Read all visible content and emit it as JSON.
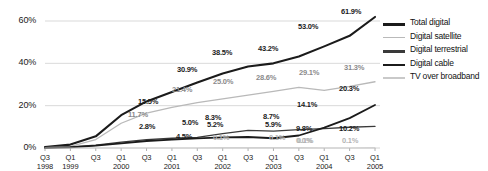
{
  "chart_data": {
    "type": "line",
    "title": "",
    "xlabel": "",
    "ylabel": "",
    "ylim": [
      0,
      68
    ],
    "yticks": [
      "0%",
      "20%",
      "40%",
      "60%"
    ],
    "ytick_values": [
      0,
      20,
      40,
      60
    ],
    "grid": true,
    "legend_position": "right",
    "x": [
      {
        "q": "Q3",
        "yr": "1998"
      },
      {
        "q": "Q1",
        "yr": "1999"
      },
      {
        "q": "Q3",
        "yr": ""
      },
      {
        "q": "Q1",
        "yr": "2000"
      },
      {
        "q": "Q3",
        "yr": ""
      },
      {
        "q": "Q1",
        "yr": "2001"
      },
      {
        "q": "Q3",
        "yr": ""
      },
      {
        "q": "Q1",
        "yr": "2002"
      },
      {
        "q": "Q3",
        "yr": ""
      },
      {
        "q": "Q1",
        "yr": "2003"
      },
      {
        "q": "Q3",
        "yr": ""
      },
      {
        "q": "Q1",
        "yr": "2004"
      },
      {
        "q": "Q3",
        "yr": ""
      },
      {
        "q": "Q1",
        "yr": "2005"
      }
    ],
    "series": [
      {
        "name": "Total digital",
        "color": "#1b1b1b",
        "width": 2.1,
        "values": [
          0.4,
          1.6,
          5.5,
          15.5,
          22.0,
          26.5,
          30.9,
          35.2,
          38.5,
          40.0,
          43.2,
          48.0,
          53.0,
          61.9
        ]
      },
      {
        "name": "Digital satellite",
        "color": "#b9b9b9",
        "width": 1.3,
        "values": [
          0.2,
          0.8,
          4.0,
          11.7,
          16.5,
          19.2,
          21.4,
          23.2,
          25.0,
          26.8,
          28.6,
          27.2,
          29.1,
          31.3
        ]
      },
      {
        "name": "Digital terrestrial",
        "color": "#3a3a3a",
        "width": 1.3,
        "values": [
          0.1,
          0.5,
          1.3,
          2.8,
          4.0,
          4.6,
          5.0,
          6.8,
          8.3,
          8.0,
          8.7,
          9.2,
          9.8,
          10.2
        ]
      },
      {
        "name": "Digital cable",
        "color": "#1b1b1b",
        "width": 1.8,
        "values": [
          0.1,
          0.3,
          1.1,
          2.2,
          3.3,
          4.0,
          4.5,
          5.0,
          5.2,
          4.6,
          5.9,
          9.6,
          14.1,
          20.3
        ]
      },
      {
        "name": "TV over broadband",
        "color": "#c9c9c9",
        "width": 1.2,
        "values": [
          0.0,
          0.0,
          0.0,
          0.0,
          0.0,
          0.0,
          0.0,
          0.05,
          0.1,
          0.1,
          0.1,
          0.0,
          0.0,
          0.1
        ]
      }
    ],
    "point_labels": [
      {
        "text": "15.5%",
        "x": 138,
        "y": 97,
        "tone": "dark"
      },
      {
        "text": "30.9%",
        "x": 177,
        "y": 65,
        "tone": "dark"
      },
      {
        "text": "38.5%",
        "x": 212,
        "y": 48,
        "tone": "dark"
      },
      {
        "text": "43.2%",
        "x": 258,
        "y": 44,
        "tone": "dark"
      },
      {
        "text": "53.0%",
        "x": 298,
        "y": 22,
        "tone": "dark"
      },
      {
        "text": "61.9%",
        "x": 341,
        "y": 7,
        "tone": "dark"
      },
      {
        "text": "11.7%",
        "x": 128,
        "y": 110,
        "tone": "mid"
      },
      {
        "text": "21.4%",
        "x": 172,
        "y": 85,
        "tone": "mid"
      },
      {
        "text": "25.0%",
        "x": 213,
        "y": 77,
        "tone": "mid"
      },
      {
        "text": "28.6%",
        "x": 256,
        "y": 73,
        "tone": "mid"
      },
      {
        "text": "29.1%",
        "x": 299,
        "y": 68,
        "tone": "mid"
      },
      {
        "text": "31.3%",
        "x": 344,
        "y": 63,
        "tone": "mid"
      },
      {
        "text": "2.8%",
        "x": 139,
        "y": 122,
        "tone": "dark"
      },
      {
        "text": "5.0%",
        "x": 182,
        "y": 118,
        "tone": "dark"
      },
      {
        "text": "8.3%",
        "x": 205,
        "y": 113,
        "tone": "dark"
      },
      {
        "text": "8.7%",
        "x": 263,
        "y": 112,
        "tone": "dark"
      },
      {
        "text": "14.1%",
        "x": 297,
        "y": 100,
        "tone": "dark"
      },
      {
        "text": "20.3%",
        "x": 339,
        "y": 84,
        "tone": "dark"
      },
      {
        "text": "4.5%",
        "x": 176,
        "y": 132,
        "tone": "dark"
      },
      {
        "text": "5.2%",
        "x": 207,
        "y": 120,
        "tone": "dark"
      },
      {
        "text": "5.9%",
        "x": 265,
        "y": 120,
        "tone": "dark"
      },
      {
        "text": "9.8%",
        "x": 296,
        "y": 124,
        "tone": "dark"
      },
      {
        "text": "10.2%",
        "x": 339,
        "y": 124,
        "tone": "dark"
      },
      {
        "text": "0.1%",
        "x": 213,
        "y": 133,
        "tone": "light"
      },
      {
        "text": "0.1%",
        "x": 269,
        "y": 133,
        "tone": "light"
      },
      {
        "text": "0.1%",
        "x": 297,
        "y": 136,
        "tone": "light"
      },
      {
        "text": "0.0%",
        "x": 296,
        "y": 136,
        "tone": "light"
      },
      {
        "text": "0.1%",
        "x": 342,
        "y": 136,
        "tone": "light"
      }
    ]
  },
  "legend": {
    "items": [
      {
        "label": "Total digital",
        "color": "#1b1b1b",
        "thickness": 3
      },
      {
        "label": "Digital satellite",
        "color": "#b9b9b9",
        "thickness": 1.5
      },
      {
        "label": "Digital terrestrial",
        "color": "#3a3a3a",
        "thickness": 2.5
      },
      {
        "label": "Digital cable",
        "color": "#1b1b1b",
        "thickness": 2.5
      },
      {
        "label": "TV over broadband",
        "color": "#c9c9c9",
        "thickness": 1.5
      }
    ]
  },
  "style": {
    "background": "#ffffff",
    "grid_color": "#cfcfcf",
    "axis_text_color": "#1a1a1a"
  }
}
